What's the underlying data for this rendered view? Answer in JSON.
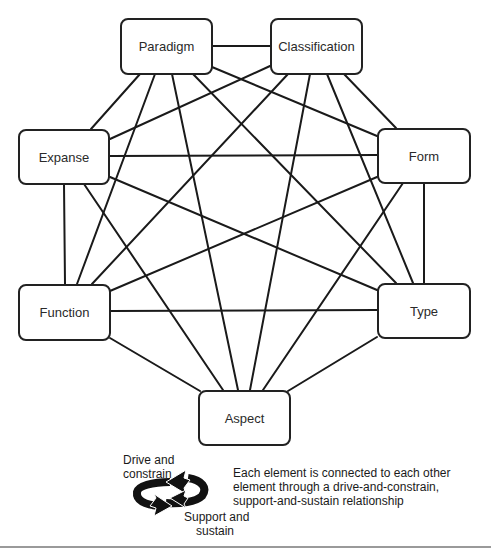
{
  "diagram": {
    "type": "complete-graph",
    "nodes": [
      {
        "id": "paradigm",
        "label": "Paradigm"
      },
      {
        "id": "classification",
        "label": "Classification"
      },
      {
        "id": "expanse",
        "label": "Expanse"
      },
      {
        "id": "form",
        "label": "Form"
      },
      {
        "id": "function",
        "label": "Function"
      },
      {
        "id": "type",
        "label": "Type"
      },
      {
        "id": "aspect",
        "label": "Aspect"
      }
    ],
    "edges": [
      [
        "paradigm",
        "classification"
      ],
      [
        "paradigm",
        "expanse"
      ],
      [
        "paradigm",
        "form"
      ],
      [
        "paradigm",
        "function"
      ],
      [
        "paradigm",
        "type"
      ],
      [
        "paradigm",
        "aspect"
      ],
      [
        "classification",
        "expanse"
      ],
      [
        "classification",
        "form"
      ],
      [
        "classification",
        "function"
      ],
      [
        "classification",
        "type"
      ],
      [
        "classification",
        "aspect"
      ],
      [
        "expanse",
        "form"
      ],
      [
        "expanse",
        "function"
      ],
      [
        "expanse",
        "type"
      ],
      [
        "expanse",
        "aspect"
      ],
      [
        "form",
        "function"
      ],
      [
        "form",
        "type"
      ],
      [
        "form",
        "aspect"
      ],
      [
        "function",
        "type"
      ],
      [
        "function",
        "aspect"
      ],
      [
        "type",
        "aspect"
      ]
    ]
  },
  "legend": {
    "icon": "cycle-arrows-icon",
    "top_label_line1": "Drive and",
    "top_label_line2": "constrain",
    "bottom_label_line1": "Support and",
    "bottom_label_line2": "sustain",
    "description": "Each element is connected to each other element through a drive-and-constrain, support-and-sustain relationship"
  },
  "colors": {
    "line": "#1a1a1a",
    "box_border": "#222222",
    "rule": "#9a9a9a"
  }
}
